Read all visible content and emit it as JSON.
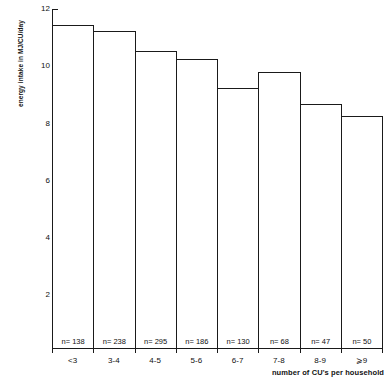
{
  "chart_data": {
    "type": "bar",
    "title": "",
    "xlabel": "number of CU's per household",
    "ylabel": "energy intake in MJ/CU/day",
    "categories": [
      "<3",
      "3-4",
      "4-5",
      "5-6",
      "6-7",
      "7-8",
      "8-9",
      "⩾9"
    ],
    "values": [
      11.45,
      11.25,
      10.55,
      10.25,
      9.25,
      9.8,
      8.7,
      8.25
    ],
    "point_labels": [
      "n= 138",
      "n= 238",
      "n= 295",
      "n= 186",
      "n= 130",
      "n= 68",
      "n= 47",
      "n= 50"
    ],
    "counts": [
      138,
      238,
      295,
      186,
      130,
      68,
      47,
      50
    ],
    "yticks": [
      2,
      4,
      6,
      8,
      10,
      12
    ],
    "ytick_labels": [
      "2",
      "4",
      "6",
      "8",
      "10",
      "12"
    ],
    "ylim": [
      0,
      12.4
    ],
    "xlim": [
      0,
      8
    ],
    "grid": false,
    "legend": null,
    "bar_fill": "#ffffff",
    "bar_edge": "#1a1a1a",
    "axis_color": "#1a1a1a"
  }
}
